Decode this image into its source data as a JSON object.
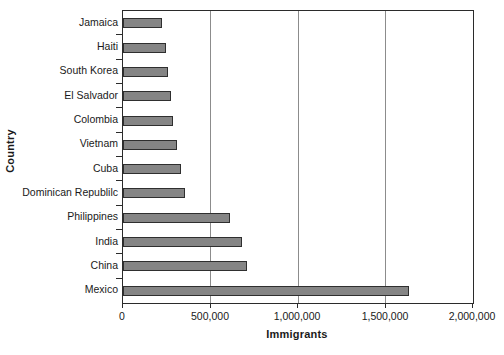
{
  "chart_data": {
    "type": "bar",
    "orientation": "horizontal",
    "title": "",
    "xlabel": "Immigrants",
    "ylabel": "Country",
    "categories": [
      "Jamaica",
      "Haiti",
      "South Korea",
      "El Salvador",
      "Colombia",
      "Vietnam",
      "Dominican Republilc",
      "Cuba",
      "Philippines",
      "India",
      "China",
      "Mexico"
    ],
    "values": [
      220000,
      245000,
      257000,
      274000,
      286000,
      308000,
      354000,
      331000,
      611000,
      680000,
      709000,
      1634000
    ],
    "plot_order_top_to_bottom": [
      "Jamaica",
      "Haiti",
      "South Korea",
      "El Salvador",
      "Colombia",
      "Vietnam",
      "Cuba",
      "Dominican Republilc",
      "Philippines",
      "India",
      "China",
      "Mexico"
    ],
    "bars": [
      {
        "label": "Jamaica",
        "value": 220000
      },
      {
        "label": "Haiti",
        "value": 245000
      },
      {
        "label": "South Korea",
        "value": 257000
      },
      {
        "label": "El Salvador",
        "value": 274000
      },
      {
        "label": "Colombia",
        "value": 286000
      },
      {
        "label": "Vietnam",
        "value": 308000
      },
      {
        "label": "Cuba",
        "value": 331000
      },
      {
        "label": "Dominican Republilc",
        "value": 354000
      },
      {
        "label": "Philippines",
        "value": 611000
      },
      {
        "label": "India",
        "value": 680000
      },
      {
        "label": "China",
        "value": 709000
      },
      {
        "label": "Mexico",
        "value": 1634000
      }
    ],
    "xlim": [
      0,
      2000000
    ],
    "xticks": [
      0,
      500000,
      1000000,
      1500000,
      2000000
    ],
    "xtick_labels": [
      "0",
      "500,000",
      "1,000,000",
      "1,500,000",
      "2,000,000"
    ],
    "grid": true,
    "grid_axis": "x",
    "legend": null,
    "colors": {
      "bar_fill": "#858585",
      "bar_edge": "#2f2f2f",
      "axis": "#2b2b2b",
      "gridline": "#8c8c8c",
      "background": "#ffffff",
      "text": "#1a1a1a"
    }
  }
}
